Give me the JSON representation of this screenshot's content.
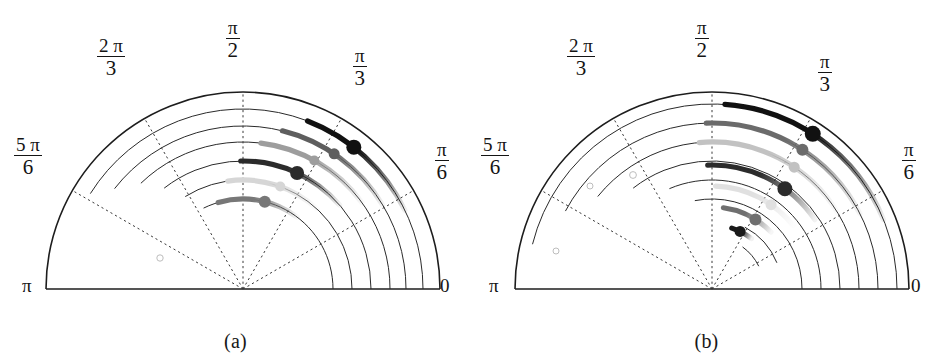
{
  "figure": {
    "width": 943,
    "height": 361,
    "background": "#ffffff",
    "type": "two-panel polar half-disc plot"
  },
  "panels": [
    {
      "id": "a",
      "caption": "(a)",
      "center": {
        "x": 243,
        "y": 289
      },
      "outer_radius": 197,
      "angle_labels": [
        {
          "name": "zero",
          "text": "0",
          "angle_rad": 0,
          "style": "plain"
        },
        {
          "name": "pi-over-6",
          "numerator": "π",
          "denominator": "6",
          "angle_rad": 0.5236,
          "style": "fraction"
        },
        {
          "name": "pi-over-3",
          "numerator": "π",
          "denominator": "3",
          "angle_rad": 1.0472,
          "style": "fraction"
        },
        {
          "name": "pi-over-2",
          "numerator": "π",
          "denominator": "2",
          "angle_rad": 1.5708,
          "style": "fraction"
        },
        {
          "name": "two-pi-over-3",
          "numerator": "2 π",
          "denominator": "3",
          "angle_rad": 2.0944,
          "style": "fraction"
        },
        {
          "name": "five-pi-over-6",
          "numerator": "5 π",
          "denominator": "6",
          "angle_rad": 2.618,
          "style": "fraction"
        },
        {
          "name": "pi",
          "text": "π",
          "angle_rad": 3.1416,
          "style": "plain"
        }
      ],
      "radial_gridlines_deg": [
        0,
        30,
        60,
        90,
        120,
        150,
        180
      ],
      "grid_arcs": [
        {
          "radius": 197,
          "start_deg": 0,
          "end_deg": 180,
          "solid_boundary": true
        },
        {
          "radius": 180,
          "start_deg": 0,
          "end_deg": 148
        },
        {
          "radius": 163,
          "start_deg": 0,
          "end_deg": 142
        },
        {
          "radius": 147,
          "start_deg": 0,
          "end_deg": 134
        },
        {
          "radius": 128,
          "start_deg": 0,
          "end_deg": 128
        },
        {
          "radius": 109,
          "start_deg": 0,
          "end_deg": 122
        },
        {
          "radius": 90,
          "start_deg": 0,
          "end_deg": 116
        }
      ],
      "data_arcs": [
        {
          "index": 1,
          "radius": 180,
          "start_deg": 26,
          "end_deg": 69,
          "color": "#111111",
          "marker_deg": 52,
          "marker_r": 7.5,
          "fade_from_deg": 69
        },
        {
          "index": 2,
          "radius": 163,
          "start_deg": 31,
          "end_deg": 76,
          "color": "#5e5e5e",
          "marker_deg": 56,
          "marker_r": 5.5,
          "fade_from_deg": 76
        },
        {
          "index": 3,
          "radius": 147,
          "start_deg": 36,
          "end_deg": 83,
          "color": "#9d9d9d",
          "marker_deg": 61,
          "marker_r": 5.0,
          "fade_from_deg": 83
        },
        {
          "index": 4,
          "radius": 128,
          "start_deg": 41,
          "end_deg": 91,
          "color": "#2b2b2b",
          "marker_deg": 65,
          "marker_r": 7.0,
          "fade_from_deg": 91
        },
        {
          "index": 5,
          "radius": 109,
          "start_deg": 47,
          "end_deg": 98,
          "color": "#d6d6d6",
          "marker_deg": 70,
          "marker_r": 5.0,
          "fade_from_deg": 98
        },
        {
          "index": 6,
          "radius": 90,
          "start_deg": 53,
          "end_deg": 106,
          "color": "#777777",
          "marker_deg": 76,
          "marker_r": 6.0,
          "fade_from_deg": 106
        }
      ],
      "faint_circles": [
        {
          "x": 160,
          "y": 258,
          "r": 3.2
        }
      ]
    },
    {
      "id": "b",
      "caption": "(b)",
      "center": {
        "x": 241,
        "y": 289
      },
      "outer_radius": 197,
      "angle_labels": [
        {
          "name": "zero",
          "text": "0",
          "angle_rad": 0,
          "style": "plain"
        },
        {
          "name": "pi-over-6",
          "numerator": "π",
          "denominator": "6",
          "angle_rad": 0.5236,
          "style": "fraction"
        },
        {
          "name": "pi-over-3",
          "numerator": "π",
          "denominator": "3",
          "angle_rad": 1.0472,
          "style": "fraction"
        },
        {
          "name": "pi-over-2",
          "numerator": "π",
          "denominator": "2",
          "angle_rad": 1.5708,
          "style": "fraction"
        },
        {
          "name": "two-pi-over-3",
          "numerator": "2 π",
          "denominator": "3",
          "angle_rad": 2.0944,
          "style": "fraction"
        },
        {
          "name": "five-pi-over-6",
          "numerator": "5 π",
          "denominator": "6",
          "angle_rad": 2.618,
          "style": "fraction"
        },
        {
          "name": "pi",
          "text": "π",
          "angle_rad": 3.1416,
          "style": "plain"
        }
      ],
      "radial_gridlines_deg": [
        0,
        30,
        60,
        90,
        120,
        150,
        180
      ],
      "grid_arcs": [
        {
          "radius": 197,
          "start_deg": 0,
          "end_deg": 180,
          "solid_boundary": true
        },
        {
          "radius": 185,
          "start_deg": 0,
          "end_deg": 166
        },
        {
          "radius": 166,
          "start_deg": 0,
          "end_deg": 152
        },
        {
          "radius": 147,
          "start_deg": 0,
          "end_deg": 141
        },
        {
          "radius": 128,
          "start_deg": 0,
          "end_deg": 128
        },
        {
          "radius": 109,
          "start_deg": 0,
          "end_deg": 113
        },
        {
          "radius": 90,
          "start_deg": 0,
          "end_deg": 101
        },
        {
          "radius": 70,
          "start_deg": 22,
          "end_deg": 62
        },
        {
          "radius": 52,
          "start_deg": 26,
          "end_deg": 54
        }
      ],
      "data_arcs": [
        {
          "index": 1,
          "radius": 185,
          "start_deg": 22,
          "end_deg": 86,
          "color": "#111111",
          "marker_deg": 57,
          "marker_r": 8.0,
          "fade_from_deg": 86
        },
        {
          "index": 2,
          "radius": 166,
          "start_deg": 27,
          "end_deg": 92,
          "color": "#6b6b6b",
          "marker_deg": 57,
          "marker_r": 6.0,
          "fade_from_deg": 92
        },
        {
          "index": 3,
          "radius": 147,
          "start_deg": 31,
          "end_deg": 95,
          "color": "#c2c2c2",
          "marker_deg": 56,
          "marker_r": 5.5,
          "fade_from_deg": 95
        },
        {
          "index": 4,
          "radius": 124,
          "start_deg": 34,
          "end_deg": 92,
          "color": "#2b2b2b",
          "marker_deg": 54,
          "marker_r": 7.5,
          "fade_from_deg": 92
        },
        {
          "index": 5,
          "radius": 103,
          "start_deg": 38,
          "end_deg": 88,
          "color": "#e0e0e0",
          "marker_deg": 55,
          "marker_r": 5.5,
          "fade_from_deg": 88
        },
        {
          "index": 6,
          "radius": 82,
          "start_deg": 44,
          "end_deg": 82,
          "color": "#6f6f6f",
          "marker_deg": 58,
          "marker_r": 6.0,
          "fade_from_deg": 82
        },
        {
          "index": 7,
          "radius": 64,
          "start_deg": 52,
          "end_deg": 72,
          "color": "#1a1a1a",
          "marker_deg": 64,
          "marker_r": 5.5,
          "fade_from_deg": 72
        }
      ],
      "faint_circles": [
        {
          "x": 119,
          "y": 186,
          "r": 3.0
        },
        {
          "x": 85,
          "y": 251,
          "r": 3.0
        },
        {
          "x": 162,
          "y": 175,
          "r": 3.4
        }
      ]
    }
  ],
  "chart_data": {
    "type": "scatter",
    "title": "",
    "subtitle": "",
    "xlabel": "",
    "ylabel": "",
    "grid": true,
    "legend_position": "none",
    "coordinate_system": "polar-half-plane",
    "theta_range_rad": [
      0,
      3.14159
    ],
    "theta_ticks_rad": [
      0,
      0.5236,
      1.0472,
      1.5708,
      2.0944,
      2.618,
      3.1416
    ],
    "theta_tick_labels": [
      "0",
      "π/6",
      "π/3",
      "π/2",
      "2π/3",
      "5π/6",
      "π"
    ],
    "r_range": [
      0,
      197
    ],
    "panels": [
      {
        "label": "(a)",
        "series": [
          {
            "name": "arc-1",
            "r": 180,
            "theta_start_deg": 26,
            "theta_end_deg": 69,
            "marker_theta_deg": 52,
            "gray": "#111111"
          },
          {
            "name": "arc-2",
            "r": 163,
            "theta_start_deg": 31,
            "theta_end_deg": 76,
            "marker_theta_deg": 56,
            "gray": "#5e5e5e"
          },
          {
            "name": "arc-3",
            "r": 147,
            "theta_start_deg": 36,
            "theta_end_deg": 83,
            "marker_theta_deg": 61,
            "gray": "#9d9d9d"
          },
          {
            "name": "arc-4",
            "r": 128,
            "theta_start_deg": 41,
            "theta_end_deg": 91,
            "marker_theta_deg": 65,
            "gray": "#2b2b2b"
          },
          {
            "name": "arc-5",
            "r": 109,
            "theta_start_deg": 47,
            "theta_end_deg": 98,
            "marker_theta_deg": 70,
            "gray": "#d6d6d6"
          },
          {
            "name": "arc-6",
            "r": 90,
            "theta_start_deg": 53,
            "theta_end_deg": 106,
            "marker_theta_deg": 76,
            "gray": "#777777"
          }
        ]
      },
      {
        "label": "(b)",
        "series": [
          {
            "name": "arc-1",
            "r": 185,
            "theta_start_deg": 22,
            "theta_end_deg": 86,
            "marker_theta_deg": 57,
            "gray": "#111111"
          },
          {
            "name": "arc-2",
            "r": 166,
            "theta_start_deg": 27,
            "theta_end_deg": 92,
            "marker_theta_deg": 57,
            "gray": "#6b6b6b"
          },
          {
            "name": "arc-3",
            "r": 147,
            "theta_start_deg": 31,
            "theta_end_deg": 95,
            "marker_theta_deg": 56,
            "gray": "#c2c2c2"
          },
          {
            "name": "arc-4",
            "r": 124,
            "theta_start_deg": 34,
            "theta_end_deg": 92,
            "marker_theta_deg": 54,
            "gray": "#2b2b2b"
          },
          {
            "name": "arc-5",
            "r": 103,
            "theta_start_deg": 38,
            "theta_end_deg": 88,
            "marker_theta_deg": 55,
            "gray": "#e0e0e0"
          },
          {
            "name": "arc-6",
            "r": 82,
            "theta_start_deg": 44,
            "theta_end_deg": 82,
            "marker_theta_deg": 58,
            "gray": "#6f6f6f"
          },
          {
            "name": "arc-7",
            "r": 64,
            "theta_start_deg": 52,
            "theta_end_deg": 72,
            "marker_theta_deg": 64,
            "gray": "#1a1a1a"
          }
        ]
      }
    ]
  }
}
